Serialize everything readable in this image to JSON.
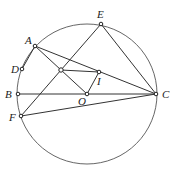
{
  "figure": {
    "type": "geometry",
    "points": [
      {
        "id": "A",
        "label": "A"
      },
      {
        "id": "D",
        "label": "D"
      },
      {
        "id": "B",
        "label": "B"
      },
      {
        "id": "F",
        "label": "F"
      },
      {
        "id": "E",
        "label": "E"
      },
      {
        "id": "C",
        "label": "C"
      },
      {
        "id": "O",
        "label": "O"
      },
      {
        "id": "I",
        "label": "I"
      },
      {
        "id": "P",
        "label": ""
      }
    ],
    "segments": [
      [
        "B",
        "C"
      ],
      [
        "A",
        "C"
      ],
      [
        "A",
        "O"
      ],
      [
        "O",
        "I"
      ],
      [
        "E",
        "C"
      ],
      [
        "E",
        "F"
      ],
      [
        "F",
        "C"
      ],
      [
        "A",
        "D"
      ],
      [
        "P",
        "I"
      ]
    ],
    "circle": {
      "center": "O",
      "through": [
        "A",
        "D",
        "B",
        "F",
        "E",
        "C"
      ]
    }
  }
}
